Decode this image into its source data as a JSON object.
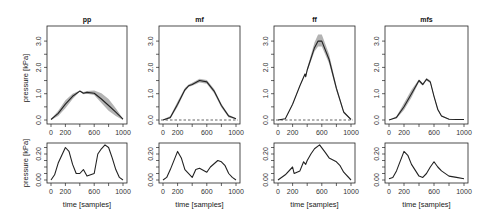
{
  "chart_data": [
    {
      "type": "line",
      "panel": "pp",
      "title": "pp",
      "xlabel": "",
      "ylabel": "pressure [kPa]",
      "xlim": [
        0,
        1000
      ],
      "ylim": [
        0,
        3.4
      ],
      "xticks": [
        0,
        200,
        600,
        1000
      ],
      "yticks": [
        0.0,
        1.0,
        2.0,
        3.0
      ],
      "ytick_labels": [
        "0.0",
        "1.0",
        "2.0",
        "3.0"
      ],
      "x": [
        0,
        100,
        200,
        300,
        400,
        450,
        500,
        600,
        700,
        800,
        900,
        1000
      ],
      "series": [
        {
          "name": "mean",
          "values": [
            0.02,
            0.25,
            0.6,
            0.9,
            1.1,
            1.02,
            1.05,
            1.02,
            0.8,
            0.55,
            0.3,
            0.03
          ]
        },
        {
          "name": "upper",
          "values": [
            0.04,
            0.35,
            0.75,
            1.0,
            1.12,
            1.06,
            1.1,
            1.12,
            1.02,
            0.8,
            0.45,
            0.05
          ]
        },
        {
          "name": "lower",
          "values": [
            0.0,
            0.15,
            0.45,
            0.8,
            1.08,
            0.98,
            1.0,
            0.95,
            0.65,
            0.35,
            0.15,
            0.0
          ]
        }
      ],
      "zero_line": false
    },
    {
      "type": "line",
      "panel": "mf",
      "title": "mf",
      "ylim": [
        0,
        3.4
      ],
      "xticks": [
        0,
        200,
        600,
        1000
      ],
      "yticks": [
        0.0,
        1.0,
        2.0,
        3.0
      ],
      "x": [
        0,
        100,
        200,
        300,
        350,
        400,
        500,
        600,
        700,
        800,
        900,
        1000
      ],
      "series": [
        {
          "name": "mean",
          "values": [
            0.0,
            0.1,
            0.6,
            1.15,
            1.3,
            1.35,
            1.5,
            1.45,
            1.1,
            0.55,
            0.15,
            0.05
          ]
        },
        {
          "name": "upper",
          "values": [
            0.02,
            0.15,
            0.7,
            1.22,
            1.35,
            1.42,
            1.57,
            1.52,
            1.18,
            0.62,
            0.2,
            0.07
          ]
        },
        {
          "name": "lower",
          "values": [
            0.0,
            0.05,
            0.5,
            1.08,
            1.25,
            1.3,
            1.43,
            1.38,
            1.02,
            0.48,
            0.1,
            0.03
          ]
        }
      ],
      "zero_line": true
    },
    {
      "type": "line",
      "panel": "ff",
      "title": "ff",
      "ylim": [
        0,
        3.4
      ],
      "xticks": [
        0,
        200,
        600,
        1000
      ],
      "yticks": [
        0.0,
        1.0,
        2.0,
        3.0
      ],
      "x": [
        0,
        100,
        200,
        300,
        370,
        380,
        400,
        500,
        550,
        600,
        700,
        800,
        900,
        1000
      ],
      "series": [
        {
          "name": "mean",
          "values": [
            0.0,
            0.05,
            0.6,
            1.3,
            1.75,
            1.65,
            1.9,
            2.75,
            3.0,
            3.0,
            2.3,
            1.2,
            0.3,
            0.02
          ]
        },
        {
          "name": "upper",
          "values": [
            0.0,
            0.06,
            0.62,
            1.32,
            1.78,
            1.7,
            1.98,
            2.95,
            3.25,
            3.25,
            2.5,
            1.3,
            0.35,
            0.03
          ]
        },
        {
          "name": "lower",
          "values": [
            0.0,
            0.04,
            0.58,
            1.28,
            1.72,
            1.6,
            1.84,
            2.6,
            2.8,
            2.8,
            2.15,
            1.1,
            0.25,
            0.01
          ]
        }
      ],
      "zero_line": true
    },
    {
      "type": "line",
      "panel": "mfs",
      "title": "mfs",
      "ylim": [
        0,
        3.4
      ],
      "xticks": [
        0,
        200,
        600,
        1000
      ],
      "yticks": [
        0.0,
        1.0,
        2.0,
        3.0
      ],
      "x": [
        0,
        100,
        200,
        300,
        400,
        450,
        500,
        550,
        600,
        650,
        700,
        800,
        900,
        1000
      ],
      "series": [
        {
          "name": "mean",
          "values": [
            0.0,
            0.1,
            0.5,
            1.0,
            1.5,
            1.35,
            1.55,
            1.45,
            0.9,
            0.4,
            0.15,
            0.03,
            0.02,
            0.02
          ]
        },
        {
          "name": "upper",
          "values": [
            0.0,
            0.14,
            0.65,
            1.15,
            1.55,
            1.4,
            1.6,
            1.5,
            0.95,
            0.45,
            0.18,
            0.05,
            0.03,
            0.03
          ]
        },
        {
          "name": "lower",
          "values": [
            0.0,
            0.06,
            0.38,
            0.85,
            1.45,
            1.3,
            1.5,
            1.4,
            0.85,
            0.35,
            0.12,
            0.02,
            0.01,
            0.01
          ]
        }
      ],
      "zero_line": false
    },
    {
      "type": "line",
      "panel": "pp-std",
      "ylabel": "pressure [kPa]",
      "xlabel": "time [samples]",
      "ylim": [
        0,
        0.27
      ],
      "xticks": [
        0,
        200,
        600,
        1000
      ],
      "yticks": [
        0.0,
        0.05,
        0.1,
        0.15,
        0.2,
        0.25
      ],
      "ytick_labels": [
        "0.00",
        "0.20"
      ],
      "x": [
        0,
        50,
        100,
        200,
        250,
        300,
        350,
        400,
        450,
        500,
        600,
        650,
        700,
        750,
        800,
        850,
        900,
        950,
        1000
      ],
      "values": [
        0.0,
        0.04,
        0.13,
        0.25,
        0.22,
        0.12,
        0.05,
        0.05,
        0.08,
        0.03,
        0.05,
        0.2,
        0.24,
        0.27,
        0.25,
        0.17,
        0.08,
        0.02,
        0.0
      ]
    },
    {
      "type": "line",
      "panel": "mf-std",
      "xlabel": "time [samples]",
      "ylim": [
        0,
        0.27
      ],
      "xticks": [
        0,
        200,
        600,
        1000
      ],
      "ytick_labels": [
        "0.00",
        "0.20"
      ],
      "x": [
        0,
        50,
        100,
        200,
        250,
        300,
        400,
        450,
        500,
        600,
        650,
        750,
        800,
        850,
        900,
        950,
        1000
      ],
      "values": [
        0.0,
        0.02,
        0.08,
        0.22,
        0.17,
        0.08,
        0.02,
        0.08,
        0.09,
        0.06,
        0.1,
        0.15,
        0.14,
        0.11,
        0.05,
        0.02,
        0.0
      ]
    },
    {
      "type": "line",
      "panel": "ff-std",
      "xlabel": "time [samples]",
      "ylim": [
        0,
        0.27
      ],
      "xticks": [
        0,
        200,
        600,
        1000
      ],
      "ytick_labels": [
        "0.00",
        "0.20"
      ],
      "x": [
        0,
        100,
        200,
        220,
        300,
        350,
        380,
        400,
        450,
        500,
        570,
        650,
        700,
        800,
        850,
        900,
        1000
      ],
      "values": [
        0.0,
        0.04,
        0.1,
        0.05,
        0.07,
        0.14,
        0.12,
        0.15,
        0.2,
        0.24,
        0.27,
        0.21,
        0.17,
        0.14,
        0.11,
        0.06,
        0.0
      ]
    },
    {
      "type": "line",
      "panel": "mfs-std",
      "xlabel": "time [samples]",
      "ylim": [
        0,
        0.27
      ],
      "xticks": [
        0,
        200,
        600,
        1000
      ],
      "ytick_labels": [
        "0.00",
        "0.20"
      ],
      "x": [
        0,
        50,
        100,
        200,
        250,
        300,
        400,
        450,
        500,
        550,
        600,
        650,
        700,
        800,
        900,
        1000
      ],
      "values": [
        0.01,
        0.02,
        0.07,
        0.22,
        0.19,
        0.12,
        0.03,
        0.02,
        0.05,
        0.1,
        0.14,
        0.1,
        0.07,
        0.03,
        0.02,
        0.01
      ]
    }
  ],
  "panels": [
    {
      "title": "pp"
    },
    {
      "title": "mf"
    },
    {
      "title": "ff"
    },
    {
      "title": "mfs"
    }
  ],
  "labels": {
    "ylabel": "pressure [kPa]",
    "xlabel": "time [samples]",
    "xticks": [
      "0",
      "200",
      "600",
      "1000"
    ],
    "yticks_top": [
      "0.0",
      "1.0",
      "2.0",
      "3.0"
    ],
    "yticks_bottom": [
      "0.00",
      "0.20"
    ]
  }
}
